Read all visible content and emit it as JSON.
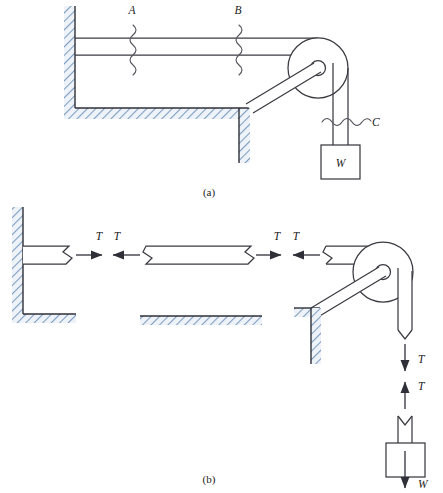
{
  "figure": {
    "panels": [
      {
        "id": "a",
        "caption": "(a)",
        "description": "Assembly: rod anchored to wall passing over a pulley, cord supporting weight W, with section cuts A, B and C"
      },
      {
        "id": "b",
        "caption": "(b)",
        "description": "Free-body diagrams of the separated segments showing tension T pairs and weight W"
      }
    ],
    "colors": {
      "line": "#3a3a42",
      "edge": "#2f2f38",
      "hatch_line": "#6f8fb4",
      "hatch_fill": "#eef3f9",
      "background": "#ffffff",
      "label_text": "#1c1c22"
    }
  },
  "panel_a": {
    "caption": "(a)",
    "section_labels": [
      {
        "name": "A",
        "text": "A",
        "type": "vertical-cut",
        "x": 135,
        "y": 10
      },
      {
        "name": "B",
        "text": "B",
        "type": "vertical-cut",
        "x": 240,
        "y": 10
      },
      {
        "name": "C",
        "text": "C",
        "type": "horizontal-cut",
        "x": 372,
        "y": 122
      }
    ],
    "weight_label": "W",
    "components": {
      "wall": "hatched-vertical-wall",
      "floor": "hatched-horizontal-floor",
      "rod": "two-line-horizontal-rod",
      "pulley": "wheel-with-hub",
      "bracket": "diagonal-support-arm",
      "cord": "two-line-vertical-cord",
      "block": "weight-block"
    }
  },
  "panel_b": {
    "caption": "(b)",
    "tension_label": "T",
    "weight_label": "W",
    "force_labels": [
      {
        "name": "T",
        "text": "T",
        "x": 103,
        "y": 238,
        "dir": "right"
      },
      {
        "name": "T",
        "text": "T",
        "x": 128,
        "y": 238,
        "dir": "left"
      },
      {
        "name": "T",
        "text": "T",
        "x": 279,
        "y": 238,
        "dir": "right"
      },
      {
        "name": "T",
        "text": "T",
        "x": 304,
        "y": 238,
        "dir": "left"
      },
      {
        "name": "T",
        "text": "T",
        "x": 424,
        "y": 355,
        "dir": "down"
      },
      {
        "name": "T",
        "text": "T",
        "x": 424,
        "y": 384,
        "dir": "up"
      },
      {
        "name": "W",
        "text": "W",
        "x": 424,
        "y": 484,
        "dir": "down"
      }
    ],
    "segments": [
      {
        "name": "left-rod-segment",
        "ends": [
          "wall-anchor",
          "break"
        ]
      },
      {
        "name": "middle-rod-segment",
        "ends": [
          "break",
          "break"
        ]
      },
      {
        "name": "right-rod-pulley-segment",
        "ends": [
          "break",
          "pulley"
        ]
      },
      {
        "name": "weight-block-segment",
        "ends": [
          "break",
          "block"
        ]
      }
    ]
  }
}
